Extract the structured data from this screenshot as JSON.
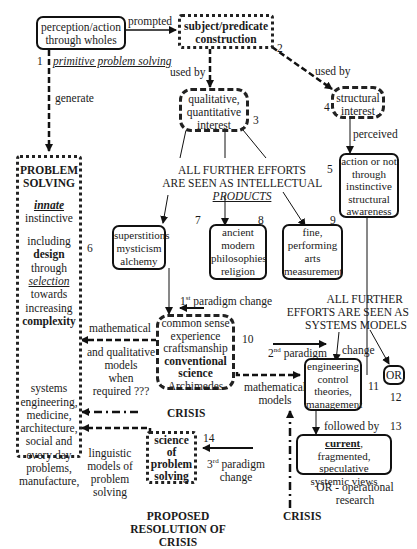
{
  "nodes": {
    "n1": {
      "line1": "perception/action",
      "line2": "through wholes",
      "number": "1",
      "caption": "primitive problem solving"
    },
    "n2": {
      "line1": "subject/predicate",
      "line2": "construction",
      "number": "2"
    },
    "n3": {
      "line1": "qualitative,",
      "line2": "quantitative",
      "line3": "interest",
      "number": "3"
    },
    "n4": {
      "line1": "structural",
      "line2": "interest",
      "number": "4"
    },
    "n5": {
      "line1": "action or not",
      "line2": "through",
      "line3": "instinctive",
      "line4": "structural",
      "line5": "awareness",
      "number": "5"
    },
    "n6": {
      "title1": "PROBLEM",
      "title2": "SOLVING",
      "innate": "innate",
      "instinctive": "instinctive",
      "including": "including",
      "design": "design",
      "through": "through",
      "selection": "selection",
      "towards": "towards",
      "increasing": "increasing",
      "complexity": "complexity",
      "systems": "systems",
      "engineering": "engineering,",
      "medicine": "medicine,",
      "architecture": "architecture,",
      "social": "social and",
      "everyday": "every day",
      "problems": "problems,",
      "manufacture": "manufacture,",
      "number": "6"
    },
    "n7": {
      "line1": "superstitions",
      "line2": "mysticism",
      "line3": "alchemy",
      "number": "7"
    },
    "n8": {
      "line1": "ancient",
      "line2": "modern",
      "line3": "philosophies",
      "line4": "religion",
      "number": "8"
    },
    "n9": {
      "line1": "fine,",
      "line2": "performing",
      "line3": "arts",
      "line4": "measurement",
      "number": "9"
    },
    "n10": {
      "line1": "common sense",
      "line2": "experience",
      "line3": "craftsmanship",
      "line4": "conventional",
      "line5": "science",
      "line6": "Archimedes",
      "number": "10"
    },
    "n11": {
      "line1": "engineering",
      "line2": "control",
      "line3": "theories,",
      "line4": "management",
      "number": "11"
    },
    "n12": {
      "line1": "OR",
      "number": "12"
    },
    "n13": {
      "bold": "current",
      "rest1": ", fragmented,",
      "line2": "speculative",
      "line3": "systemic views",
      "number": "13"
    },
    "n14": {
      "line1": "science",
      "line2": "of",
      "line3": "problem",
      "line4": "solving",
      "number": "14"
    }
  },
  "labels": {
    "prompted": "prompted",
    "used_by_left": "used by",
    "used_by_right": "used by",
    "generate": "generate",
    "perceived": "perceived",
    "intellectual_line1": "ALL FURTHER EFFORTS",
    "intellectual_line2": "ARE SEEN AS INTELLECTUAL",
    "intellectual_products": "PRODUCTS",
    "systems_line1": "ALL FURTHER",
    "systems_line2": "EFFORTS ARE SEEN AS",
    "systems_line3": "SYSTEMS MODELS",
    "paradigm1_num": "1",
    "paradigm1_sup": "st",
    "paradigm1_text": "paradigm change",
    "paradigm2_num": "2",
    "paradigm2_sup": "nd",
    "paradigm2_text": "paradigm",
    "paradigm2_change": "change",
    "paradigm3_num": "3",
    "paradigm3_sup": "rd",
    "paradigm3_text": "paradigm",
    "paradigm3_change": "change",
    "mathematical": "mathematical",
    "and_qualitative": "and qualitative",
    "models": "models",
    "when": "when",
    "required": "required ???",
    "math_models_1": "mathematical",
    "math_models_2": "models",
    "crisis_left": "CRISIS",
    "crisis_bottom": "CRISIS",
    "linguistic_1": "linguistic",
    "linguistic_2": "models of",
    "linguistic_3": "problem",
    "linguistic_4": "solving",
    "followed_by": "followed by",
    "or_def_1": "OR - operational",
    "or_def_2": "research",
    "proposed_1": "PROPOSED",
    "proposed_2": "RESOLUTION OF CRISIS"
  }
}
